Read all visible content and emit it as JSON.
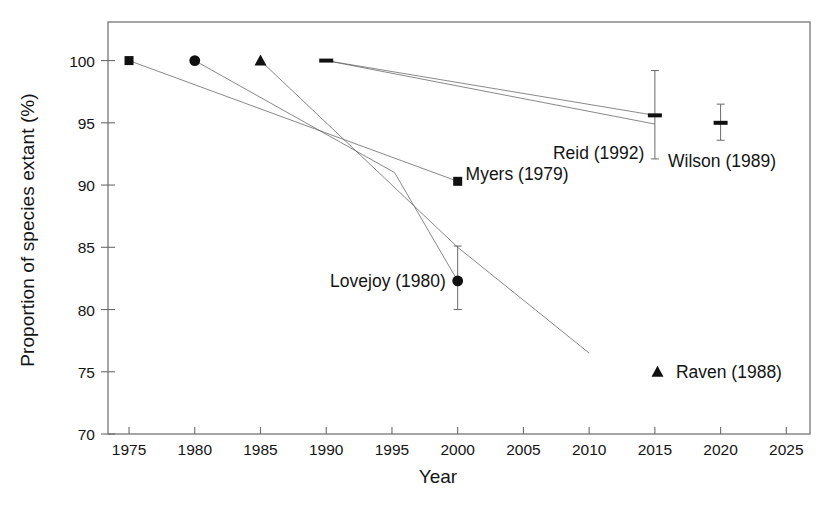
{
  "chart_data": {
    "type": "scatter",
    "title": "",
    "xlabel": "Year",
    "ylabel": "Proportion of species extant (%)",
    "xlim": [
      1973.4,
      2026.8
    ],
    "ylim": [
      70,
      103.1
    ],
    "xticks": [
      1975,
      1980,
      1985,
      1990,
      1995,
      2000,
      2005,
      2010,
      2015,
      2020,
      2025
    ],
    "xtick_labels": [
      "1975",
      "1980",
      "1985",
      "1990",
      "1995",
      "2000",
      "2005",
      "2010",
      "2015",
      "2020",
      "2025"
    ],
    "yticks": [
      70,
      75,
      80,
      85,
      90,
      95,
      100
    ],
    "ytick_labels": [
      "70",
      "75",
      "80",
      "85",
      "90",
      "95",
      "100"
    ],
    "grid": false,
    "legend": "none",
    "frame": "box",
    "series": [
      {
        "name": "Myers (1979)",
        "marker": "square",
        "label": "Myers (1979)",
        "label_x": 2000.6,
        "label_y": 90.9,
        "label_anchor": "start",
        "points": [
          {
            "x": 1975,
            "y": 100
          },
          {
            "x": 2000,
            "y": 90.3
          }
        ],
        "line": [
          {
            "x": 1975,
            "y": 100
          },
          {
            "x": 2000,
            "y": 90.3
          }
        ]
      },
      {
        "name": "Lovejoy (1980)",
        "marker": "circle",
        "label": "Lovejoy (1980)",
        "label_x": 1999.1,
        "label_y": 82.3,
        "label_anchor": "end",
        "points": [
          {
            "x": 1980,
            "y": 100
          },
          {
            "x": 2000,
            "y": 82.3,
            "err_low": 80.0,
            "err_high": 85.1
          }
        ],
        "line": [
          {
            "x": 1980,
            "y": 100
          },
          {
            "x": 1995.2,
            "y": 91.0
          },
          {
            "x": 2000,
            "y": 82.3
          }
        ]
      },
      {
        "name": "Raven (1988)",
        "marker": "triangle",
        "label": "Raven (1988)",
        "label_x": 2016.6,
        "label_y": 75.0,
        "label_anchor": "start",
        "legend_marker_x": 2015.2,
        "legend_marker_y": 75.0,
        "points": [
          {
            "x": 1985,
            "y": 100
          }
        ],
        "line": [
          {
            "x": 1985,
            "y": 100
          },
          {
            "x": 2000,
            "y": 85.0
          },
          {
            "x": 2010,
            "y": 76.5
          }
        ]
      },
      {
        "name": "Reid (1992)",
        "marker": "dash",
        "label": "Reid (1992)",
        "label_x": 2014.2,
        "label_y": 92.6,
        "label_anchor": "end",
        "points": [
          {
            "x": 1990,
            "y": 100
          },
          {
            "x": 2015,
            "y": 95.6,
            "err_low": 92.1,
            "err_high": 99.2
          }
        ],
        "line": [
          {
            "x": 1990,
            "y": 100
          },
          {
            "x": 2015,
            "y": 95.6
          }
        ],
        "line2": [
          {
            "x": 1990,
            "y": 100
          },
          {
            "x": 2015,
            "y": 94.9
          }
        ]
      },
      {
        "name": "Wilson (1989)",
        "marker": "dash",
        "label": "Wilson (1989)",
        "label_x": 2016.0,
        "label_y": 91.9,
        "label_anchor": "start",
        "points": [
          {
            "x": 2020,
            "y": 95.0,
            "err_low": 93.6,
            "err_high": 96.5
          }
        ],
        "line": []
      }
    ]
  },
  "axis": {
    "x_title": "Year",
    "y_title": "Proportion of species extant (%)"
  },
  "colors": {
    "marker": "#111111",
    "line": "#5a5a5a",
    "axis": "#6b6b6b",
    "text": "#141414"
  }
}
